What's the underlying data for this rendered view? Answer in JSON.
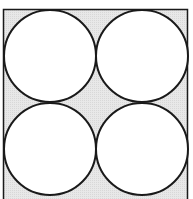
{
  "diagram": {
    "title": "",
    "colors": {
      "background": "#ffffff",
      "square_fill": "#e6e6e6",
      "stroke": "#1a1a1a",
      "circle_fill": "#ffffff"
    },
    "square": {
      "x": 3.5,
      "y": 9.5,
      "width": 184,
      "height": 192
    },
    "circles": [
      {
        "id": "top-left",
        "cx": 50,
        "cy": 56,
        "r": 46
      },
      {
        "id": "top-right",
        "cx": 142,
        "cy": 56,
        "r": 46
      },
      {
        "id": "bottom-left",
        "cx": 50,
        "cy": 149,
        "r": 46
      },
      {
        "id": "bottom-right",
        "cx": 142,
        "cy": 149,
        "r": 46
      }
    ]
  }
}
